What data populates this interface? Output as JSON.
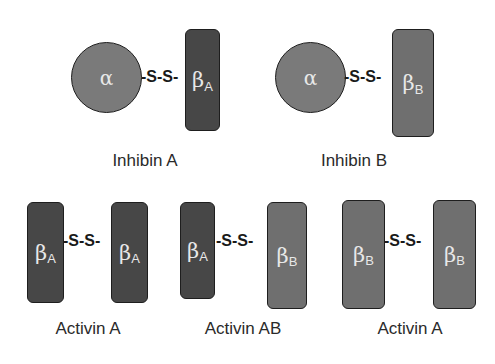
{
  "diagram": {
    "bond_label": "-S-S-",
    "molecules": [
      {
        "name": "Inhibin A",
        "left": {
          "type": "circle",
          "symbol": "α"
        },
        "right": {
          "type": "rect",
          "symbol": "β",
          "subscript": "A",
          "color": "#474747"
        }
      },
      {
        "name": "Inhibin B",
        "left": {
          "type": "circle",
          "symbol": "α"
        },
        "right": {
          "type": "rect",
          "symbol": "β",
          "subscript": "B",
          "color": "#6f6f6f"
        }
      },
      {
        "name": "Activin A",
        "left": {
          "type": "rect",
          "symbol": "β",
          "subscript": "A",
          "color": "#474747"
        },
        "right": {
          "type": "rect",
          "symbol": "β",
          "subscript": "A",
          "color": "#474747"
        }
      },
      {
        "name": "Activin AB",
        "left": {
          "type": "rect",
          "symbol": "β",
          "subscript": "A",
          "color": "#474747"
        },
        "right": {
          "type": "rect",
          "symbol": "β",
          "subscript": "B",
          "color": "#6f6f6f"
        }
      },
      {
        "name": "Activin A",
        "left": {
          "type": "rect",
          "symbol": "β",
          "subscript": "B",
          "color": "#6f6f6f"
        },
        "right": {
          "type": "rect",
          "symbol": "β",
          "subscript": "B",
          "color": "#6f6f6f"
        }
      }
    ]
  },
  "colors": {
    "alpha_subunit": "#7a7a7a",
    "beta_a_subunit": "#474747",
    "beta_b_subunit": "#6f6f6f"
  }
}
